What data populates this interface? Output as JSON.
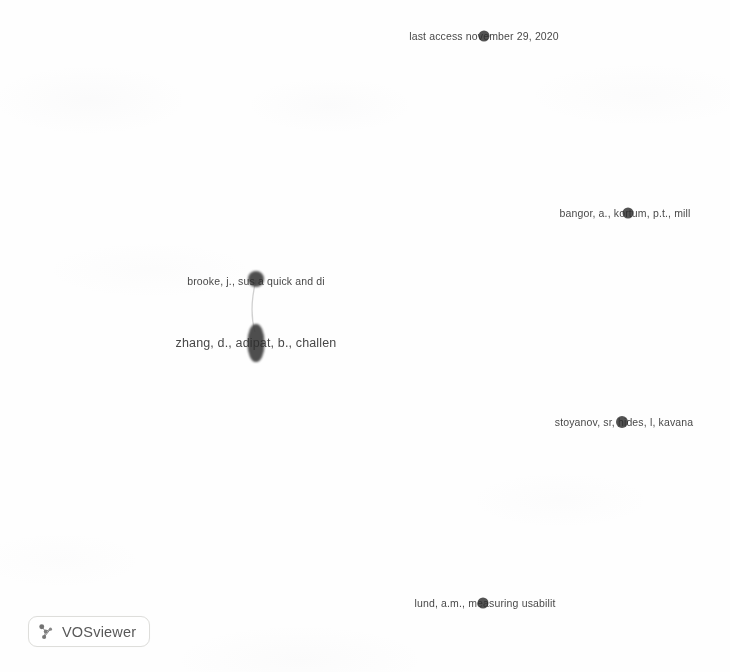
{
  "app": {
    "name": "VOSviewer",
    "logo_icon": "network-cluster-icon",
    "canvas_background": "#fefefe"
  },
  "map": {
    "type": "bibliometric-network",
    "width": 730,
    "height": 672,
    "node_color": "#3c3c3c",
    "label_color": "#2e2e2e",
    "nodes": [
      {
        "id": "last-access",
        "label": "last access november 29, 2020",
        "x": 484,
        "y": 36,
        "size": 11,
        "label_x": 484,
        "label_y": 36
      },
      {
        "id": "bangor",
        "label": "bangor, a., kortum, p.t., mill",
        "x": 628,
        "y": 213,
        "size": 11,
        "label_x": 625,
        "label_y": 213
      },
      {
        "id": "brooke",
        "label": "brooke, j., sus a quick and di",
        "x": 256,
        "y": 279,
        "size": 16,
        "label_x": 256,
        "label_y": 281
      },
      {
        "id": "zhang",
        "label": "zhang, d., adipat, b., challen",
        "x": 256,
        "y": 343,
        "size": 17,
        "label_x": 256,
        "label_y": 343
      },
      {
        "id": "stoyanov",
        "label": "stoyanov, sr, hides, l, kavana",
        "x": 622,
        "y": 422,
        "size": 12,
        "label_x": 624,
        "label_y": 422
      },
      {
        "id": "lund",
        "label": "lund, a.m., measuring usabilit",
        "x": 483,
        "y": 603,
        "size": 11,
        "label_x": 485,
        "label_y": 603
      }
    ],
    "links": [
      {
        "from": "brooke",
        "to": "zhang"
      }
    ]
  }
}
